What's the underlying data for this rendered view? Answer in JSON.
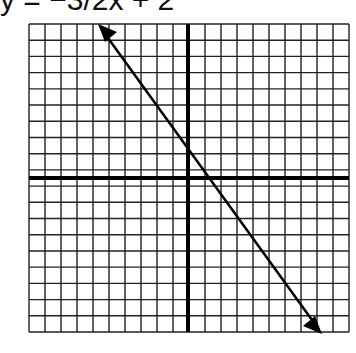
{
  "title": "y = −3/2x + 2",
  "chart_data": {
    "type": "line",
    "xlabel": "",
    "ylabel": "",
    "grid": true,
    "xlim": [
      -10,
      10
    ],
    "ylim": [
      -10,
      10
    ],
    "series": [
      {
        "name": "y = -3/2x + 2",
        "x": [
          -6,
          8.5
        ],
        "y": [
          11,
          -10.75
        ],
        "arrows": "both"
      }
    ],
    "slope": -1.5,
    "intercept": 2
  }
}
